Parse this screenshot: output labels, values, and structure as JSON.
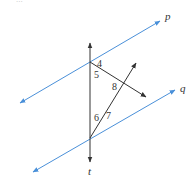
{
  "header": {
    "partial_text": "..."
  },
  "diagram": {
    "colors": {
      "parallel_line": "#4a90d9",
      "transversal": "#333333",
      "text": "#333333"
    },
    "lines": [
      {
        "id": "p",
        "label": "p",
        "type": "parallel"
      },
      {
        "id": "q",
        "label": "q",
        "type": "parallel"
      },
      {
        "id": "t",
        "label": "t",
        "type": "transversal"
      }
    ],
    "angles": [
      "4",
      "5",
      "6",
      "7",
      "8"
    ]
  }
}
